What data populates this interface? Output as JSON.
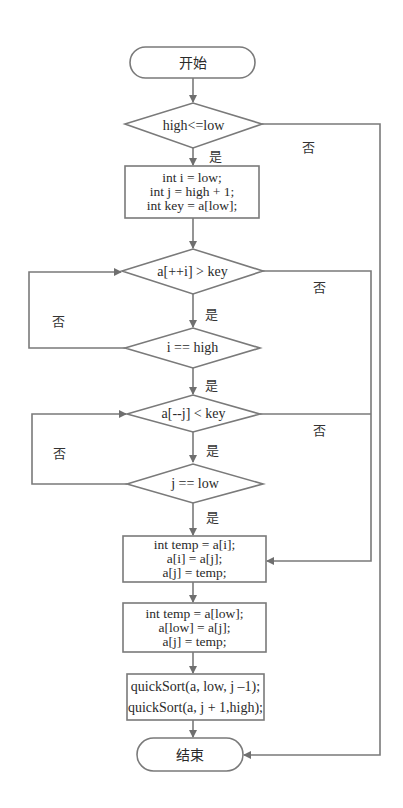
{
  "flowchart": {
    "start": {
      "label": "开始"
    },
    "end": {
      "label": "结束"
    },
    "decisions": [
      {
        "label": "high<=low",
        "yes": "是",
        "no": "否"
      },
      {
        "label": "a[++i] > key",
        "yes": "是",
        "no": "否"
      },
      {
        "label": "i == high",
        "yes": "是",
        "no": "否"
      },
      {
        "label": "a[--j] < key",
        "yes": "是",
        "no": "否"
      },
      {
        "label": "j == low",
        "yes": "是",
        "no": "否"
      }
    ],
    "processes": [
      {
        "lines": [
          "int i = low;",
          "int j = high + 1;",
          "int key = a[low];"
        ]
      },
      {
        "lines": [
          "int temp = a[i];",
          "a[i] = a[j];",
          "a[j] = temp;"
        ]
      },
      {
        "lines": [
          "int temp = a[low];",
          "a[low] = a[j];",
          "a[j] = temp;"
        ]
      },
      {
        "lines": [
          "quickSort(a, low, j –1);",
          "quickSort(a, j + 1,high);"
        ]
      }
    ],
    "colors": {
      "stroke": "#7a7a7a",
      "text": "#2a2a2a",
      "background": "#ffffff"
    }
  }
}
